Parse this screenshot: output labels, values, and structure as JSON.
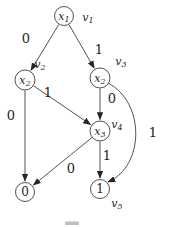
{
  "figure": {
    "width": 170,
    "height": 227,
    "background": "#ffffff",
    "line_color": "#3e3e3e",
    "text_color": "#262626",
    "type": "binary-decision-diagram"
  },
  "nodes": [
    {
      "id": "v1",
      "kind": "decision",
      "var": "x",
      "var_sub": "1",
      "cx": 64,
      "cy": 16,
      "r": 9.5,
      "tag_base": "v",
      "tag_sub": "1",
      "tag_x": 88,
      "tag_y": 17
    },
    {
      "id": "v2",
      "kind": "decision",
      "var": "x",
      "var_sub": "2",
      "cx": 25,
      "cy": 80,
      "r": 10,
      "tag_base": "v",
      "tag_sub": "2",
      "tag_x": 40,
      "tag_y": 64
    },
    {
      "id": "v3",
      "kind": "decision",
      "var": "x",
      "var_sub": "2",
      "cx": 100,
      "cy": 78,
      "r": 10,
      "tag_base": "v",
      "tag_sub": "3",
      "tag_x": 121,
      "tag_y": 61
    },
    {
      "id": "v4",
      "kind": "decision",
      "var": "x",
      "var_sub": "3",
      "cx": 100,
      "cy": 131,
      "r": 10,
      "tag_base": "v",
      "tag_sub": "4",
      "tag_x": 117,
      "tag_y": 124
    },
    {
      "id": "t0",
      "kind": "terminal",
      "value": "0",
      "cx": 25,
      "cy": 192,
      "r": 9.5
    },
    {
      "id": "t1",
      "kind": "terminal",
      "value": "1",
      "cx": 100,
      "cy": 189,
      "r": 9.5,
      "tag_base": "v",
      "tag_sub": "5",
      "tag_x": 117,
      "tag_y": 203
    }
  ],
  "edges": [
    {
      "from": "v1",
      "to": "v2",
      "label": "0",
      "label_x": 26,
      "label_y": 38
    },
    {
      "from": "v1",
      "to": "v3",
      "label": "1",
      "label_x": 99,
      "label_y": 49
    },
    {
      "from": "v2",
      "to": "t0",
      "label": "0",
      "label_x": 11,
      "label_y": 115
    },
    {
      "from": "v2",
      "to": "v4",
      "label": "1",
      "label_x": 48,
      "label_y": 92
    },
    {
      "from": "v3",
      "to": "v4",
      "label": "0",
      "label_x": 112,
      "label_y": 98
    },
    {
      "from": "v3",
      "to": "t1",
      "label": "1",
      "label_x": 153,
      "label_y": 132,
      "path": "M 108 83 C 145 102 145 166 108 182"
    },
    {
      "from": "v4",
      "to": "t1",
      "label": "1",
      "label_x": 107,
      "label_y": 155
    },
    {
      "from": "v4",
      "to": "t0",
      "label": "0",
      "label_x": 71,
      "label_y": 168
    }
  ],
  "caption_fragment": {
    "x": 65,
    "y": 221.5,
    "width": 14,
    "height": 3.5,
    "color": "#a9a9a9"
  }
}
